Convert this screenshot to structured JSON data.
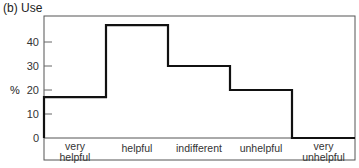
{
  "title": "(b)  Use",
  "chart_data": {
    "type": "bar",
    "title": "(b) Use",
    "xlabel": "",
    "ylabel": "%",
    "ylim": [
      0,
      50
    ],
    "yticks": [
      0,
      10,
      20,
      30,
      40
    ],
    "categories": [
      "very helpful",
      "helpful",
      "indifferent",
      "unhelpful",
      "very unhelpful"
    ],
    "values": [
      17,
      47,
      30,
      20,
      0
    ],
    "grid": false,
    "style": "step histogram outline"
  },
  "labels": {
    "y_unit": "%",
    "ticks": [
      "0",
      "10",
      "20",
      "30",
      "40"
    ],
    "cats": [
      [
        "very",
        "helpful"
      ],
      [
        "helpful"
      ],
      [
        "indifferent"
      ],
      [
        "unhelpful"
      ],
      [
        "very",
        "unhelpful"
      ]
    ]
  }
}
